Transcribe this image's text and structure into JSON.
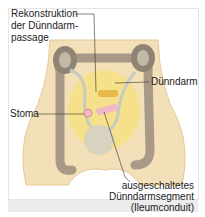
{
  "labels": {
    "reconstruction_line1": "Rekonstruktion",
    "reconstruction_line2": "der Dünndarm-",
    "reconstruction_line3": "passage",
    "small_intestine": "Dünndarm",
    "stoma": "Stoma",
    "segment_line1": "ausgeschaltetes",
    "segment_line2": "Dünndarmsegment",
    "segment_line3": "(Ileumconduit)"
  },
  "colors": {
    "skin": "#f3dfb8",
    "skin_edge": "#e6c99a",
    "colon": "#a89a86",
    "kidney": "#8f8373",
    "ureter": "#c9c9c4",
    "intestine": "#f4e27a",
    "conduit": "#f2b8c8",
    "bladder": "#d8d2c0",
    "leader_line": "#333333"
  }
}
